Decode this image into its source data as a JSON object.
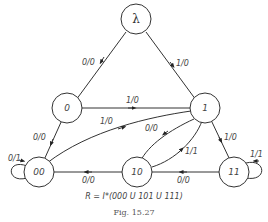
{
  "diagram": {
    "type": "state-transition-diagram",
    "nodes": [
      {
        "id": "lambda",
        "label": "λ"
      },
      {
        "id": "0",
        "label": "0"
      },
      {
        "id": "1",
        "label": "1"
      },
      {
        "id": "00",
        "label": "00"
      },
      {
        "id": "10",
        "label": "10"
      },
      {
        "id": "11",
        "label": "11"
      }
    ],
    "edges": [
      {
        "from": "lambda",
        "to": "0",
        "label": "0/0"
      },
      {
        "from": "lambda",
        "to": "1",
        "label": "1/0"
      },
      {
        "from": "0",
        "to": "1",
        "label": "1/0"
      },
      {
        "from": "0",
        "to": "00",
        "label": "0/0"
      },
      {
        "from": "00",
        "to": "1",
        "label": "1/0"
      },
      {
        "from": "00",
        "to": "00",
        "label": "0/1"
      },
      {
        "from": "1",
        "to": "10",
        "label": "0/0"
      },
      {
        "from": "10",
        "to": "1",
        "label": "1/1"
      },
      {
        "from": "1",
        "to": "11",
        "label": "1/0"
      },
      {
        "from": "11",
        "to": "11",
        "label": "1/1"
      },
      {
        "from": "11",
        "to": "10",
        "label": "0/0"
      },
      {
        "from": "10",
        "to": "00",
        "label": "0/0"
      }
    ],
    "formula": "R = I*(000 U 101 U 111)",
    "caption": "Fig. 15.27"
  }
}
